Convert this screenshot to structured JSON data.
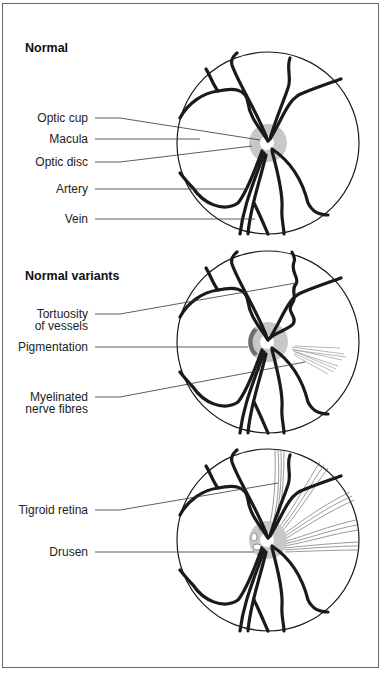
{
  "panels": [
    {
      "title": "Normal",
      "labels": [
        "Optic cup",
        "Macula",
        "Optic disc",
        "Artery",
        "Vein"
      ]
    },
    {
      "title": "Normal variants",
      "labels": [
        "Tortuosity",
        "of vessels",
        "Pigmentation",
        "Myelinated",
        "nerve fibres"
      ]
    },
    {
      "title": "",
      "labels": [
        "Tigroid retina",
        "Drusen"
      ]
    }
  ],
  "colors": {
    "vessel": "#1a1a1a",
    "disc": "#c8c8c8",
    "pigment": "#6e6e6e",
    "frame": "#666666"
  }
}
